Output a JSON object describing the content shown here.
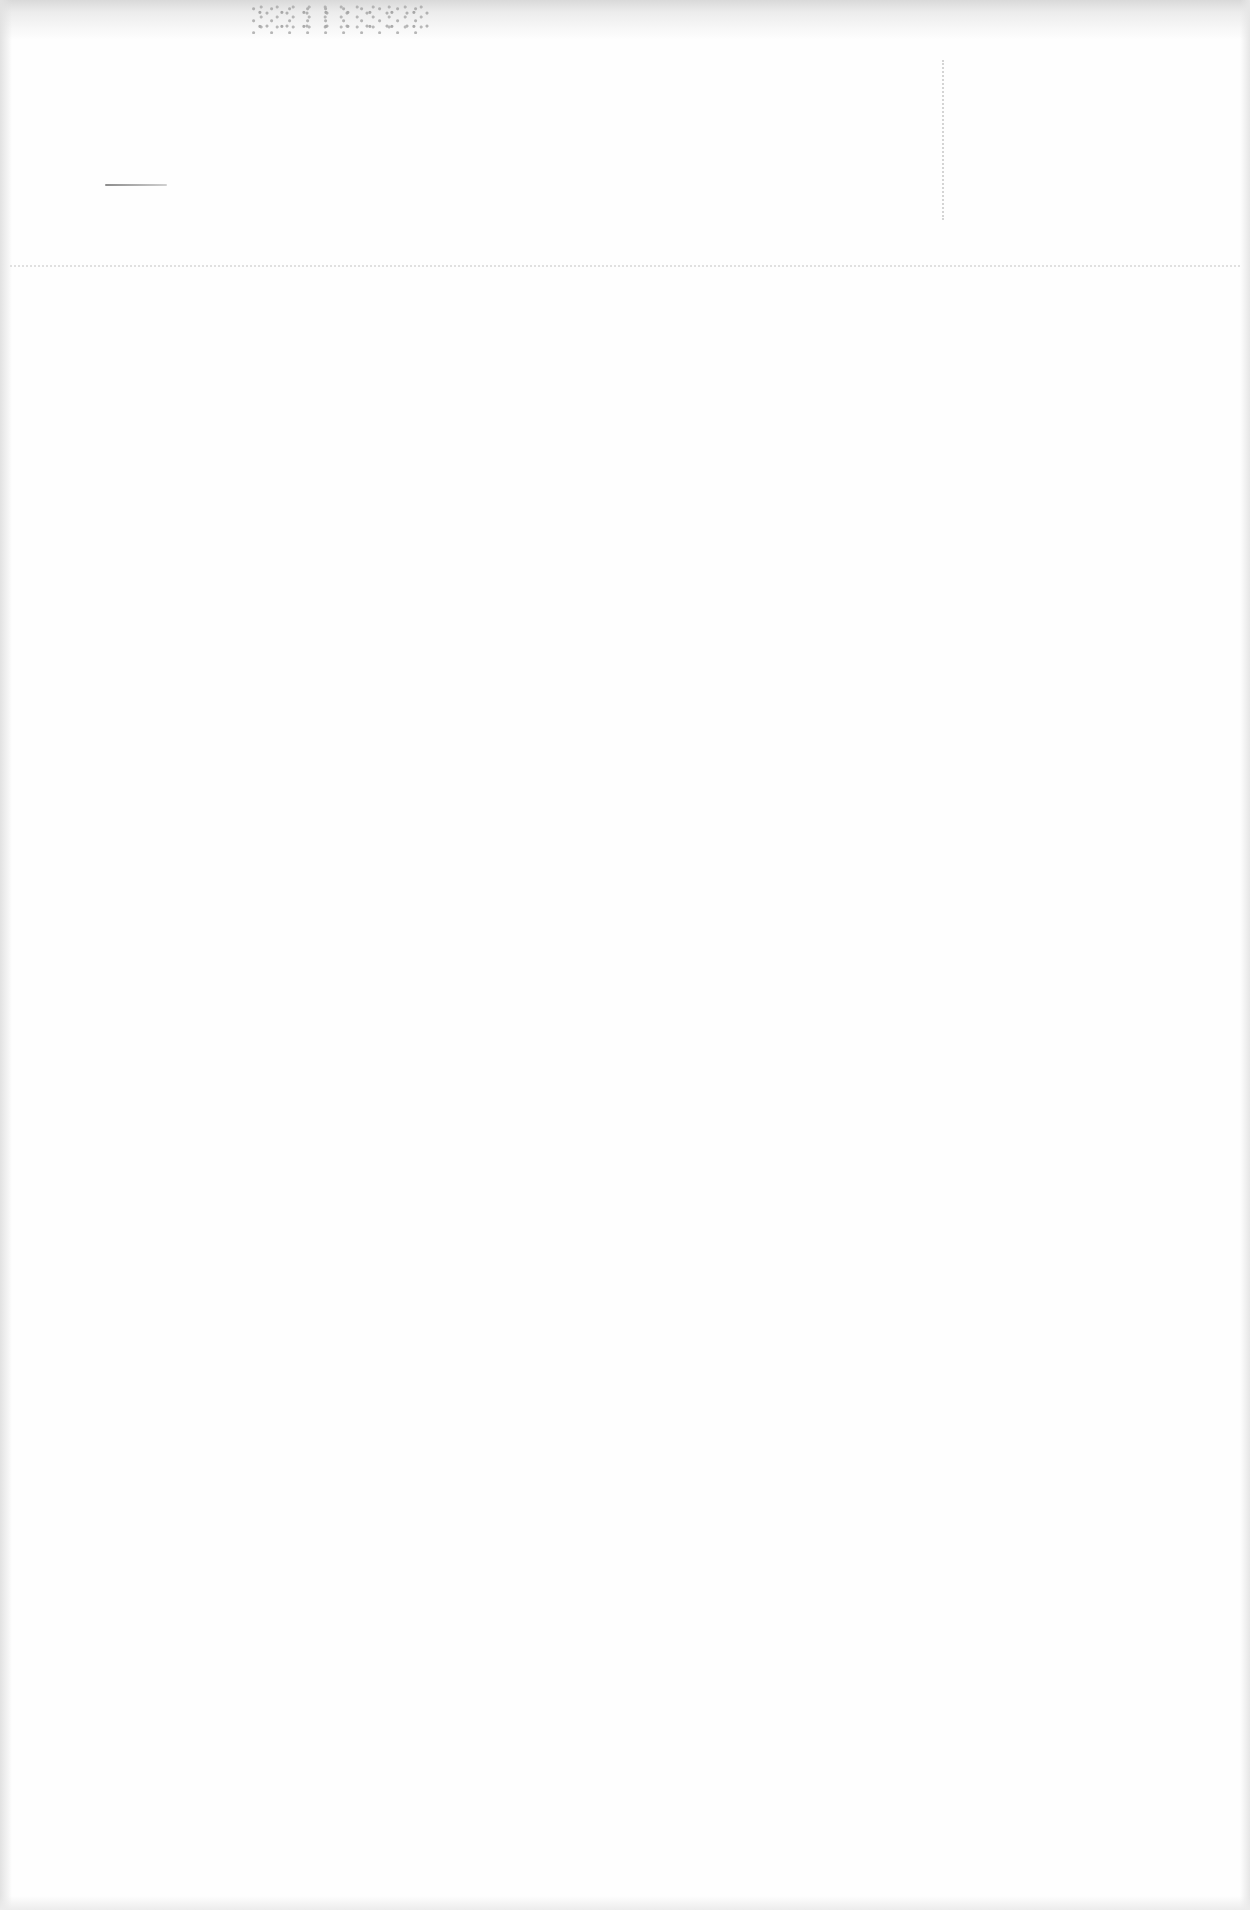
{
  "document": {
    "type": "blank scanned page",
    "text": "",
    "colors": {
      "paper": "#fefefe",
      "edge_shadow": "#d9d9d9",
      "marks": "#8c8c8c"
    }
  }
}
